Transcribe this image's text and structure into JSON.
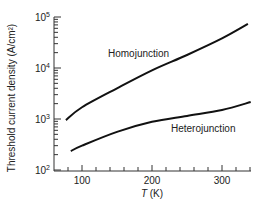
{
  "chart_data": {
    "type": "line",
    "title": "",
    "xlabel_italic": "T",
    "xlabel_unit": " (K)",
    "xlabel": "T (K)",
    "ylabel": "Threshold current density (A/cm²)",
    "xscale": "linear",
    "yscale": "log",
    "xlim": [
      70,
      345
    ],
    "ylim": [
      100,
      100000
    ],
    "x_ticks": [
      100,
      200,
      300
    ],
    "x_tick_labels": [
      "100",
      "200",
      "300"
    ],
    "y_ticks": [
      100,
      1000,
      10000,
      100000
    ],
    "y_tick_labels": [
      {
        "base": "10",
        "exp": "2"
      },
      {
        "base": "10",
        "exp": "3"
      },
      {
        "base": "10",
        "exp": "4"
      },
      {
        "base": "10",
        "exp": "5"
      }
    ],
    "grid": false,
    "legend": "inline labels",
    "series": [
      {
        "name": "Homojunction",
        "x": [
          77,
          100,
          150,
          200,
          250,
          300,
          337
        ],
        "y": [
          950,
          1700,
          4000,
          9000,
          18000,
          38000,
          73000
        ]
      },
      {
        "name": "Heterojunction",
        "x": [
          84,
          100,
          150,
          200,
          250,
          300,
          341
        ],
        "y": [
          235,
          300,
          560,
          880,
          1150,
          1500,
          2150
        ]
      }
    ]
  }
}
